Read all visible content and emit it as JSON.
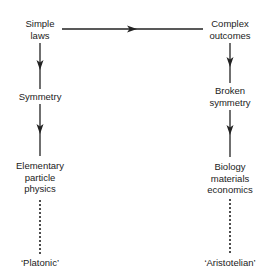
{
  "diagram": {
    "left_column": {
      "nodes": [
        {
          "id": "simple-laws",
          "lines": [
            "Simple",
            "laws"
          ]
        },
        {
          "id": "symmetry",
          "lines": [
            "Symmetry"
          ]
        },
        {
          "id": "elementary-particle-physics",
          "lines": [
            "Elementary",
            "particle",
            "physics"
          ]
        }
      ],
      "footer": "‘Platonic’"
    },
    "right_column": {
      "nodes": [
        {
          "id": "complex-outcomes",
          "lines": [
            "Complex",
            "outcomes"
          ]
        },
        {
          "id": "broken-symmetry",
          "lines": [
            "Broken",
            "symmetry"
          ]
        },
        {
          "id": "biology-materials-economics",
          "lines": [
            "Biology",
            "materials",
            "economics"
          ]
        }
      ],
      "footer": "‘Aristotelian’"
    },
    "edges": [
      {
        "from": "simple-laws",
        "to": "complex-outcomes",
        "style": "solid-arrow"
      },
      {
        "from": "simple-laws",
        "to": "symmetry",
        "style": "solid-arrow"
      },
      {
        "from": "symmetry",
        "to": "elementary-particle-physics",
        "style": "solid-arrow"
      },
      {
        "from": "elementary-particle-physics",
        "to": "Platonic",
        "style": "dotted"
      },
      {
        "from": "complex-outcomes",
        "to": "broken-symmetry",
        "style": "solid-arrow"
      },
      {
        "from": "broken-symmetry",
        "to": "biology-materials-economics",
        "style": "solid-arrow"
      },
      {
        "from": "biology-materials-economics",
        "to": "Aristotelian",
        "style": "dotted"
      }
    ],
    "line_color": "#222222"
  }
}
